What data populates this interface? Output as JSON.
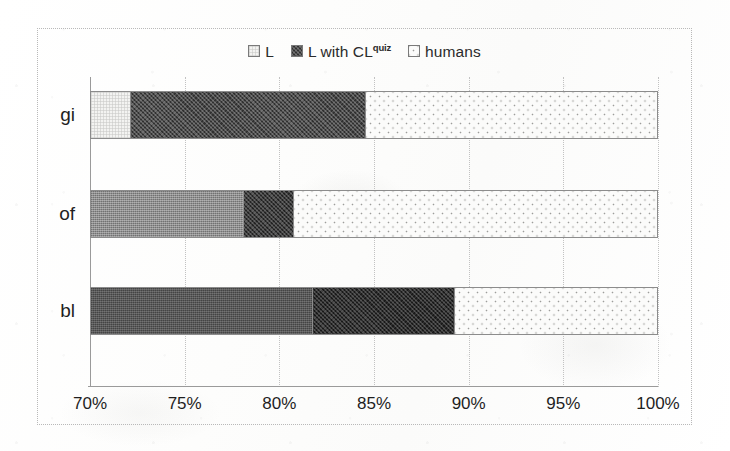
{
  "chart_data": {
    "type": "bar",
    "orientation": "horizontal",
    "stacked": true,
    "title": "",
    "xlabel": "",
    "ylabel": "",
    "categories": [
      "gi",
      "of",
      "bl"
    ],
    "xlim": [
      70,
      100
    ],
    "xticks": [
      70,
      75,
      80,
      85,
      90,
      95,
      100
    ],
    "xtick_labels": [
      "70%",
      "75%",
      "80%",
      "85%",
      "90%",
      "95%",
      "100%"
    ],
    "grid": true,
    "legend_position": "top-center",
    "series": [
      {
        "name": "L",
        "legend_label": "L",
        "values": [
          72.1,
          78.1,
          81.7
        ]
      },
      {
        "name": "L with CL quiz",
        "legend_label": "L with CL",
        "legend_sup": "quiz",
        "values": [
          84.5,
          80.7,
          89.2
        ]
      },
      {
        "name": "humans",
        "legend_label": "humans",
        "values": [
          100,
          100,
          100
        ]
      }
    ],
    "cumulative_note": "values are cumulative right-edges of each stacked segment, in percent",
    "segments": [
      {
        "category": "gi",
        "parts": [
          {
            "series": "L",
            "from": 70.0,
            "to": 72.1
          },
          {
            "series": "L with CL quiz",
            "from": 72.1,
            "to": 84.5
          },
          {
            "series": "humans",
            "from": 84.5,
            "to": 100.0
          }
        ]
      },
      {
        "category": "of",
        "parts": [
          {
            "series": "L",
            "from": 70.0,
            "to": 78.1
          },
          {
            "series": "L with CL quiz",
            "from": 78.1,
            "to": 80.7
          },
          {
            "series": "humans",
            "from": 80.7,
            "to": 100.0
          }
        ]
      },
      {
        "category": "bl",
        "parts": [
          {
            "series": "L",
            "from": 70.0,
            "to": 81.7
          },
          {
            "series": "L with CL quiz",
            "from": 81.7,
            "to": 89.2
          },
          {
            "series": "humans",
            "from": 89.2,
            "to": 100.0
          }
        ]
      }
    ]
  },
  "legend": {
    "entries": [
      {
        "label": "L",
        "sup": "",
        "swatch": "legend-swatch-l"
      },
      {
        "label": "L with CL",
        "sup": "quiz",
        "swatch": "legend-swatch-cl"
      },
      {
        "label": "humans",
        "sup": "",
        "swatch": "legend-swatch-humans"
      }
    ]
  },
  "axis": {
    "categories": [
      "gi",
      "of",
      "bl"
    ],
    "ticks": [
      "70%",
      "75%",
      "80%",
      "85%",
      "90%",
      "95%",
      "100%"
    ]
  },
  "colors": {
    "plot_border": "#b9b9b9",
    "gridline": "#c2c2c2",
    "axis_line": "#9a9a9a",
    "bar_outline": "#8c8c8c",
    "text": "#1f1f1f",
    "background": "#ffffff"
  }
}
